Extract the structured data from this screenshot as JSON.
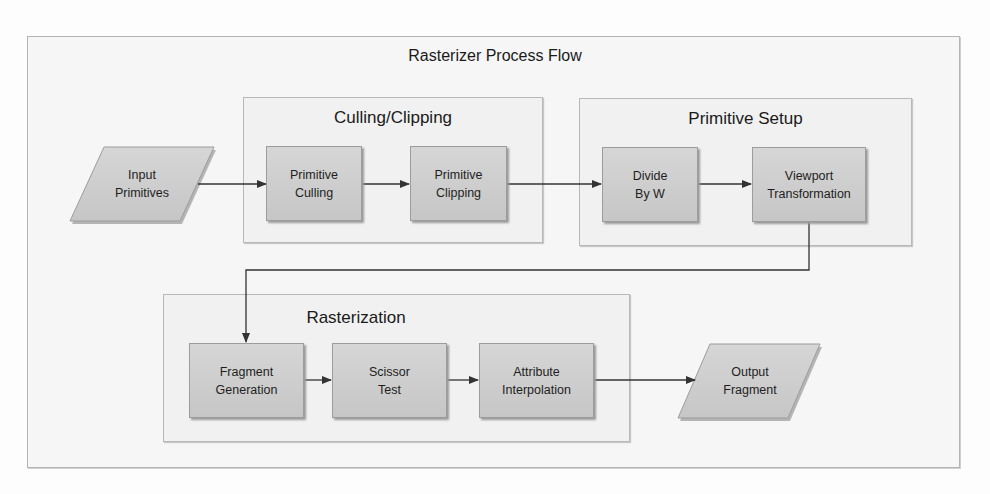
{
  "diagram": {
    "title": "Rasterizer Process Flow",
    "colors": {
      "background": "#f6f6f6",
      "group_fill": "#f1f1f1",
      "group_border": "#b8b8b8",
      "process_fill": "#cecece",
      "process_border": "#9c9c9c",
      "connector": "#333333",
      "text": "#1e1e1e"
    },
    "input": {
      "line1": "Input",
      "line2": "Primitives"
    },
    "output": {
      "line1": "Output",
      "line2": "Fragment"
    },
    "groups": [
      {
        "title": "Culling/Clipping",
        "steps": [
          {
            "line1": "Primitive",
            "line2": "Culling"
          },
          {
            "line1": "Primitive",
            "line2": "Clipping"
          }
        ]
      },
      {
        "title": "Primitive Setup",
        "steps": [
          {
            "line1": "Divide",
            "line2": "By W"
          },
          {
            "line1": "Viewport",
            "line2": "Transformation"
          }
        ]
      },
      {
        "title": "Rasterization",
        "steps": [
          {
            "line1": "Fragment",
            "line2": "Generation"
          },
          {
            "line1": "Scissor",
            "line2": "Test"
          },
          {
            "line1": "Attribute",
            "line2": "Interpolation"
          }
        ]
      }
    ],
    "flow": [
      "Input Primitives",
      "Primitive Culling",
      "Primitive Clipping",
      "Divide By W",
      "Viewport Transformation",
      "Fragment Generation",
      "Scissor Test",
      "Attribute Interpolation",
      "Output Fragment"
    ]
  }
}
